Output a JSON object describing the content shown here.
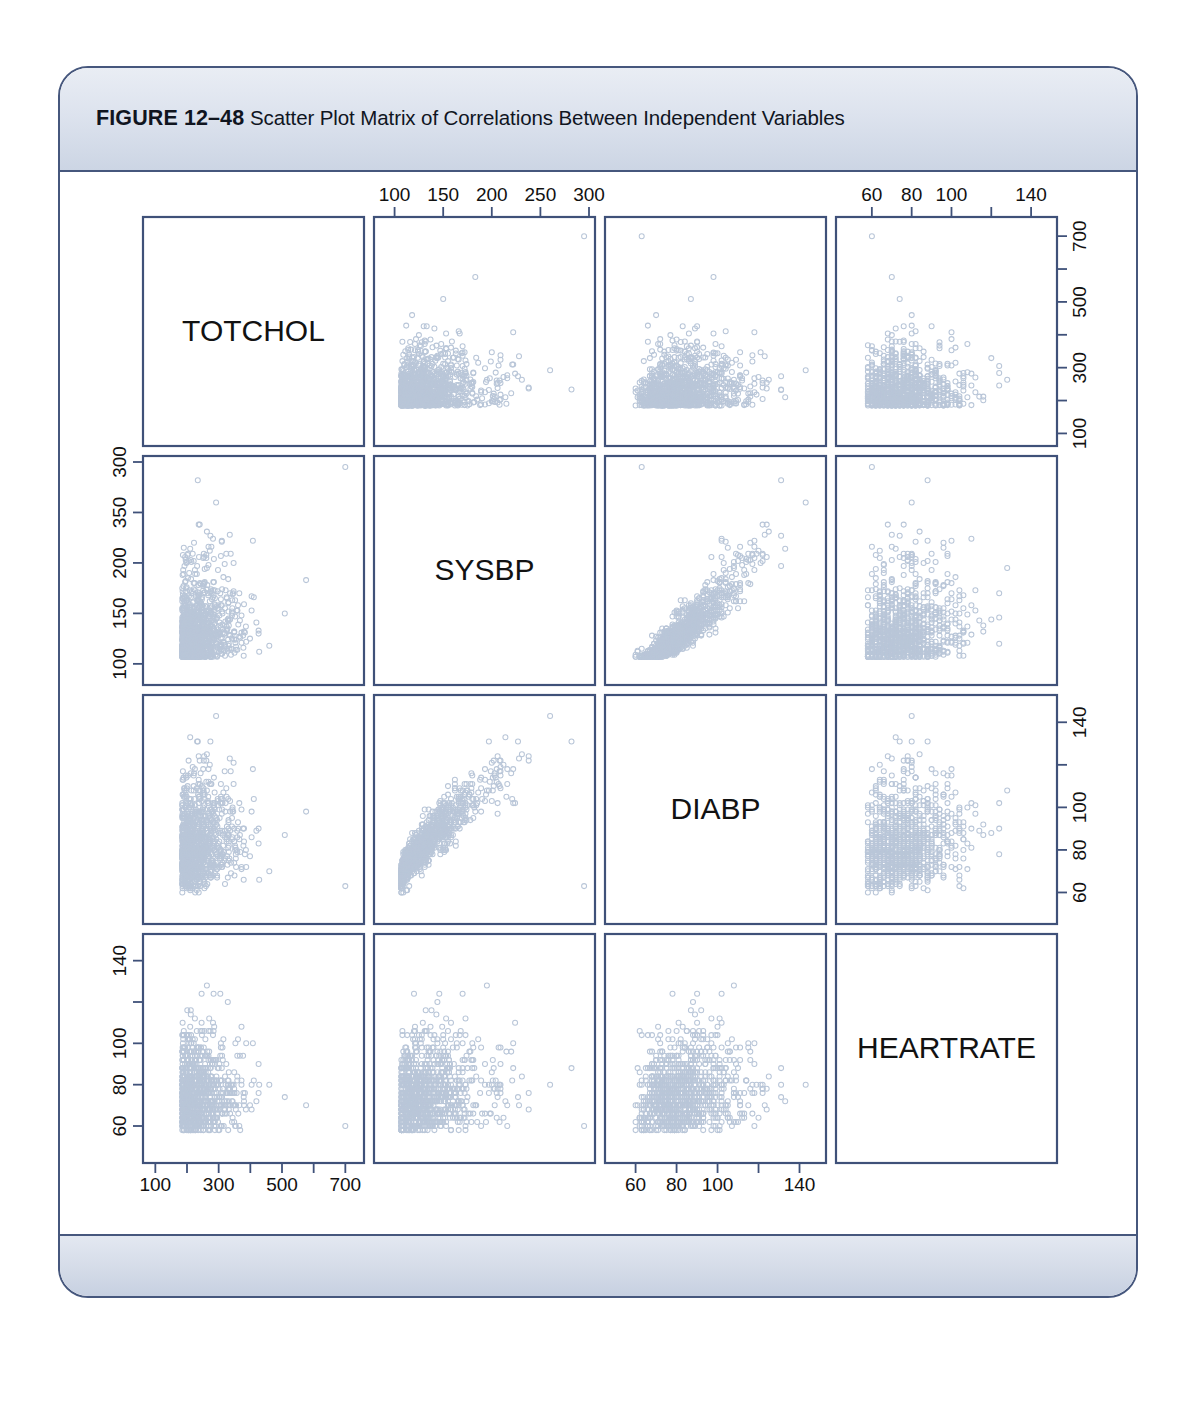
{
  "figure": {
    "number_label": "FIGURE 12–48",
    "caption": "Scatter Plot Matrix of Correlations Between Independent Variables"
  },
  "chart_data": {
    "type": "scatter",
    "title": "Scatter Plot Matrix of Correlations Between Independent Variables",
    "subtitle": "",
    "layout": "scatter-plot-matrix",
    "grid": false,
    "legend": "none",
    "n_points_per_panel": 1100,
    "variables": [
      {
        "name": "TOTCHOL",
        "label": "TOTCHOL",
        "range": [
          80,
          740
        ],
        "mean": 237,
        "sd": 45,
        "skew": 0.95,
        "discrete_step": 1
      },
      {
        "name": "SYSBP",
        "label": "SYSBP",
        "range": [
          85,
          300
        ],
        "mean": 133,
        "sd": 22,
        "skew": 0.9,
        "discrete_step": 1
      },
      {
        "name": "DIABP",
        "label": "DIABP",
        "range": [
          48,
          150
        ],
        "mean": 83,
        "sd": 12,
        "skew": 0.45,
        "discrete_step": 1
      },
      {
        "name": "HEARTRATE",
        "label": "HEARTRATE",
        "range": [
          45,
          150
        ],
        "mean": 76,
        "sd": 12,
        "skew": 0.6,
        "discrete_step": 2
      }
    ],
    "correlations": [
      [
        1.0,
        0.18,
        0.18,
        0.07
      ],
      [
        0.18,
        1.0,
        0.78,
        0.18
      ],
      [
        0.18,
        0.78,
        1.0,
        0.18
      ],
      [
        0.07,
        0.18,
        0.18,
        1.0
      ]
    ],
    "axes": {
      "totchol_bottom": {
        "variable": "TOTCHOL",
        "side": "bottom",
        "column": 1,
        "ticks": [
          100,
          200,
          300,
          400,
          500,
          600,
          700
        ],
        "labels": [
          "100",
          "",
          "300",
          "",
          "500",
          "",
          "700"
        ]
      },
      "sysbp_top": {
        "variable": "SYSBP",
        "side": "top",
        "column": 2,
        "ticks": [
          100,
          150,
          200,
          250,
          300
        ],
        "labels": [
          "100",
          "150",
          "200",
          "250",
          "300"
        ]
      },
      "diabp_bottom": {
        "variable": "DIABP",
        "side": "bottom",
        "column": 3,
        "ticks": [
          60,
          80,
          100,
          120,
          140
        ],
        "labels": [
          "60",
          "80",
          "100",
          "",
          "140"
        ]
      },
      "heartrate_top": {
        "variable": "HEARTRATE",
        "side": "top",
        "column": 4,
        "ticks": [
          60,
          80,
          100,
          120,
          140
        ],
        "labels": [
          "60",
          "80",
          "100",
          "",
          "140"
        ]
      },
      "totchol_right": {
        "variable": "TOTCHOL",
        "side": "right",
        "row": 1,
        "ticks": [
          100,
          200,
          300,
          400,
          500,
          600,
          700
        ],
        "labels": [
          "100",
          "",
          "300",
          "",
          "500",
          "",
          "700"
        ]
      },
      "sysbp_left": {
        "variable": "SYSBP",
        "side": "left",
        "row": 2,
        "ticks": [
          100,
          150,
          200,
          250,
          300
        ],
        "labels": [
          "100",
          "150",
          "200",
          "350",
          "300"
        ]
      },
      "diabp_right": {
        "variable": "DIABP",
        "side": "right",
        "row": 3,
        "ticks": [
          60,
          80,
          100,
          120,
          140
        ],
        "labels": [
          "60",
          "80",
          "100",
          "",
          "140"
        ]
      },
      "heartrate_left": {
        "variable": "HEARTRATE",
        "side": "left",
        "row": 4,
        "ticks": [
          60,
          80,
          100,
          120,
          140
        ],
        "labels": [
          "60",
          "80",
          "100",
          "",
          "140"
        ]
      }
    },
    "colors": {
      "point": "#b9c6d8",
      "panel_border": "#3f5179",
      "card_border": "#46577d",
      "header_band": "#dce2ed",
      "text": "#111111"
    }
  }
}
